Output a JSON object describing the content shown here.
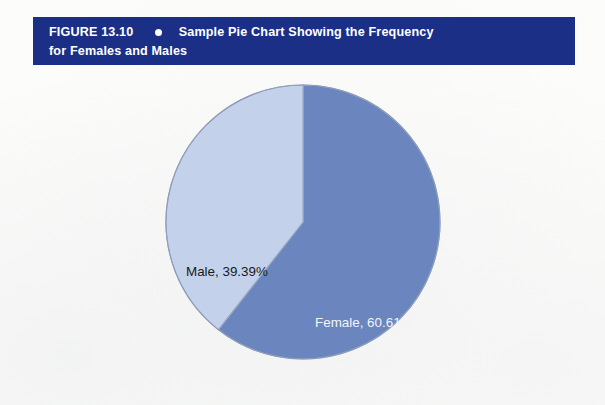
{
  "figure": {
    "number_label": "FIGURE 13.10",
    "bullet_icon": "bullet-dot-icon",
    "title_line1": "Sample Pie Chart Showing the Frequency",
    "title_line2": "for Females and Males",
    "banner_color": "#1c2f87",
    "banner_text_color": "#ffffff"
  },
  "chart_data": {
    "type": "pie",
    "title": "Sample Pie Chart Showing the Frequency for Females and Males",
    "xlabel": "",
    "ylabel": "",
    "legend_position": "none",
    "grid": false,
    "start_angle_deg": 0,
    "direction": "clockwise",
    "categories": [
      "Female",
      "Male"
    ],
    "values": [
      60.61,
      39.39
    ],
    "units": "percent",
    "slices": [
      {
        "name": "Female",
        "value": 60.61,
        "label": "Female, 60.61%",
        "color": "#6b85be",
        "label_color": "#f2f5fa",
        "start_angle_deg": 0,
        "end_angle_deg": 218.2
      },
      {
        "name": "Male",
        "value": 39.39,
        "label": "Male, 39.39%",
        "color": "#c3d2ea",
        "label_color": "#1a1a1a",
        "start_angle_deg": 218.2,
        "end_angle_deg": 360
      }
    ],
    "stroke_color": "#9aa9c4",
    "background": "#fcfcfa"
  }
}
